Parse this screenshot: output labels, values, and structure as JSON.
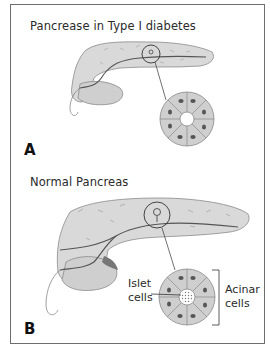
{
  "panel_a": {
    "title": "Pancrease in Type I diabetes",
    "letter": "A",
    "islet_state": "absent"
  },
  "panel_b": {
    "title": "Normal Pancreas",
    "letter": "B",
    "islet_state": "present",
    "labels": {
      "islet_line1": "Islet",
      "islet_line2": "cells",
      "acinar_line1": "Acinar",
      "acinar_line2": "cells"
    }
  },
  "colors": {
    "frame": "#6e6e6e",
    "organ_fill": "#d9d9d9",
    "organ_outline": "#8a8a8a",
    "duct": "#555555",
    "cell_fill": "#cfcfcf",
    "nucleus": "#555555",
    "text": "#2a2a2a"
  }
}
